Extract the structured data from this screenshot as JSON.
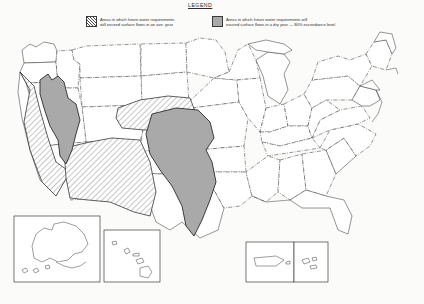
{
  "legend": {
    "title": "LEGEND",
    "entries": [
      {
        "swatch": "diagonal-hatch-swatch",
        "label": "Areas in which future water requirements\nwill exceed surface flows in an ave. year"
      },
      {
        "swatch": "solid-gray-swatch",
        "label": "Areas in which future water requirements will\nexceed surface flows in a dry year — 80% exceedance level"
      }
    ]
  },
  "map": {
    "name": "united-states-water-requirements-map",
    "colors": {
      "hatch_line": "#4a4a4a",
      "solid_fill": "#a9a9a9",
      "outline": "#3c3c3c",
      "background": "#fbfbf9"
    },
    "regions": [
      {
        "name": "great-basin-solid-region",
        "pattern": "solid",
        "description": "Nevada and western Utah — dry year exceedance"
      },
      {
        "name": "central-plains-solid-region",
        "pattern": "solid",
        "description": "Kansas, Oklahoma, Texas — dry year exceedance"
      },
      {
        "name": "california-coastal-hatch-region",
        "pattern": "hatch",
        "description": "California — average year exceedance"
      },
      {
        "name": "southwest-hatch-region",
        "pattern": "hatch",
        "description": "Arizona, New Mexico, southern Colorado — average year exceedance"
      },
      {
        "name": "high-plains-hatch-region",
        "pattern": "hatch",
        "description": "Nebraska, eastern Colorado, Kansas — average year exceedance"
      }
    ],
    "insets": [
      {
        "name": "alaska-inset",
        "label": ""
      },
      {
        "name": "hawaii-inset",
        "label": ""
      },
      {
        "name": "puerto-rico-inset",
        "label": ""
      },
      {
        "name": "virgin-islands-inset",
        "label": ""
      }
    ]
  }
}
